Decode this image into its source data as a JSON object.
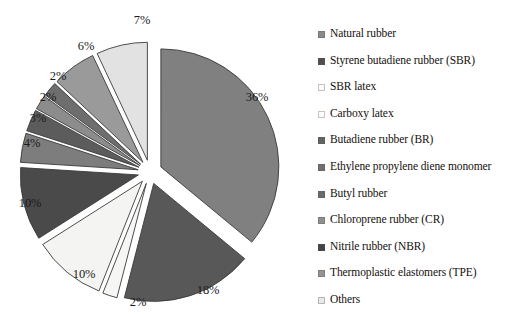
{
  "chart_data": {
    "type": "pie",
    "title": "",
    "exploded": true,
    "legend_position": "right",
    "grid": false,
    "categories": [
      "Natural rubber",
      "Styrene butadiene rubber (SBR)",
      "SBR latex",
      "Carboxy latex",
      "Butadiene rubber (BR)",
      "Ethylene propylene diene monomer",
      "Butyl rubber",
      "Chloroprene rubber (CR)",
      "Nitrile rubber (NBR)",
      "Thermoplastic elastomers (TPE)",
      "Others"
    ],
    "values": [
      36,
      18,
      10,
      2,
      2,
      2,
      3,
      4,
      10,
      6,
      7
    ],
    "value_labels": [
      "36%",
      "18%",
      "10%",
      "2%",
      "2%",
      "2%",
      "3%",
      "4%",
      "10%",
      "6%",
      "7%"
    ],
    "colors": [
      "#808080",
      "#585858",
      "#f4f4f2",
      "#f4f4f2",
      "#6e6e6e",
      "#8c8c8c",
      "#5c5c5c",
      "#7d7d7d",
      "#4a4a4a",
      "#9a9a9a",
      "#e2e2e2"
    ],
    "slices": [
      {
        "label": "Natural rubber",
        "percent": 36,
        "display": "36%",
        "color": "#808080",
        "start_deg": 0,
        "sweep_deg": 129.6,
        "label_x": 257,
        "label_y": 97
      },
      {
        "label": "Styrene butadiene rubber (SBR)",
        "percent": 18,
        "display": "18%",
        "color": "#585858",
        "start_deg": 129.6,
        "sweep_deg": 64.8,
        "label_x": 208,
        "label_y": 290
      },
      {
        "label": "Carboxy latex",
        "percent": 2,
        "display": "2%",
        "color": "#f6f6f4",
        "start_deg": 194.4,
        "sweep_deg": 7.2,
        "label_x": 138,
        "label_y": 302
      },
      {
        "label": "SBR latex",
        "percent": 10,
        "display": "10%",
        "color": "#f4f4f2",
        "start_deg": 201.6,
        "sweep_deg": 36.0,
        "label_x": 84,
        "label_y": 274
      },
      {
        "label": "Nitrile rubber (NBR)",
        "percent": 10,
        "display": "10%",
        "color": "#4a4a4a",
        "start_deg": 237.6,
        "sweep_deg": 36.0,
        "label_x": 30,
        "label_y": 203
      },
      {
        "label": "Chloroprene rubber (CR)",
        "percent": 4,
        "display": "4%",
        "color": "#7d7d7d",
        "start_deg": 273.6,
        "sweep_deg": 14.4,
        "label_x": 32,
        "label_y": 143
      },
      {
        "label": "Butyl rubber",
        "percent": 3,
        "display": "3%",
        "color": "#5c5c5c",
        "start_deg": 288.0,
        "sweep_deg": 10.8,
        "label_x": 38,
        "label_y": 118
      },
      {
        "label": "Ethylene propylene diene monomer",
        "percent": 2,
        "display": "2%",
        "color": "#8c8c8c",
        "start_deg": 298.8,
        "sweep_deg": 7.2,
        "label_x": 48,
        "label_y": 97
      },
      {
        "label": "Butadiene rubber (BR)",
        "percent": 2,
        "display": "2%",
        "color": "#6e6e6e",
        "start_deg": 306.0,
        "sweep_deg": 7.2,
        "label_x": 58,
        "label_y": 76
      },
      {
        "label": "Thermoplastic elastomers (TPE)",
        "percent": 6,
        "display": "6%",
        "color": "#9a9a9a",
        "start_deg": 313.2,
        "sweep_deg": 21.6,
        "label_x": 86,
        "label_y": 46
      },
      {
        "label": "Others",
        "percent": 7,
        "display": "7%",
        "color": "#e2e2e2",
        "start_deg": 334.8,
        "sweep_deg": 25.2,
        "label_x": 142,
        "label_y": 20
      }
    ]
  },
  "legend": {
    "items": [
      {
        "label": "Natural rubber",
        "color": "#8a8a8a"
      },
      {
        "label": "Styrene butadiene rubber (SBR)",
        "color": "#4f4f4f"
      },
      {
        "label": "SBR latex",
        "color": "#fbfbfb"
      },
      {
        "label": "Carboxy latex",
        "color": "#fdfdfd"
      },
      {
        "label": "Butadiene rubber (BR)",
        "color": "#636363"
      },
      {
        "label": "Ethylene propylene diene monomer",
        "color": "#6f6f6f"
      },
      {
        "label": "Butyl rubber",
        "color": "#6a6a6a"
      },
      {
        "label": "Chloroprene rubber (CR)",
        "color": "#8f8f8f"
      },
      {
        "label": "Nitrile rubber (NBR)",
        "color": "#434343"
      },
      {
        "label": "Thermoplastic elastomers (TPE)",
        "color": "#949494"
      },
      {
        "label": "Others",
        "color": "#e8e8e8"
      }
    ]
  }
}
